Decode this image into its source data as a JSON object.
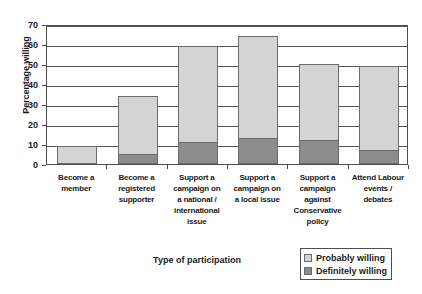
{
  "chart_data": {
    "type": "bar",
    "stacked": true,
    "title": "",
    "xlabel": "Type of participation",
    "ylabel": "Percentage willing",
    "ylim": [
      0,
      70
    ],
    "ytick_step": 10,
    "yticks": [
      0,
      10,
      20,
      30,
      40,
      50,
      60,
      70
    ],
    "grid": true,
    "legend_position": "bottom-right",
    "categories": [
      "Become a member",
      "Become a registered supporter",
      "Support a campaign on a national / international issue",
      "Support a campaign on a local issue",
      "Support a campaign against Conservative policy",
      "Attend Labour events / debates"
    ],
    "category_lines": [
      [
        "Become a",
        "member"
      ],
      [
        "Become a",
        "registered",
        "supporter"
      ],
      [
        "Support a",
        "campaign on",
        "a national /",
        "international",
        "issue"
      ],
      [
        "Support a",
        "campaign on",
        "a local issue"
      ],
      [
        "Support a",
        "campaign",
        "against",
        "Conservative",
        "policy"
      ],
      [
        "Attend Labour",
        "events /",
        "debates"
      ]
    ],
    "series": [
      {
        "name": "Definitely willing",
        "color": "#8c8c8c",
        "values": [
          0,
          5,
          11,
          13,
          12,
          7
        ]
      },
      {
        "name": "Probably willing",
        "color": "#d4d4d4",
        "values": [
          9,
          29,
          48,
          51,
          38,
          42
        ]
      }
    ],
    "totals": [
      9,
      34,
      59,
      64,
      50,
      49
    ]
  },
  "legend": {
    "items": [
      {
        "label": "Probably willing",
        "swatch": "light"
      },
      {
        "label": "Definitely willing",
        "swatch": "dark"
      }
    ]
  },
  "axis": {
    "y_title": "Percentage willing",
    "x_title": "Type of participation",
    "y_ticks": [
      "70",
      "60",
      "50",
      "40",
      "30",
      "20",
      "10",
      "0"
    ]
  },
  "colors": {
    "probably_willing": "#d4d4d4",
    "definitely_willing": "#8c8c8c",
    "axis": "#4d4d4d",
    "background": "#ffffff"
  }
}
